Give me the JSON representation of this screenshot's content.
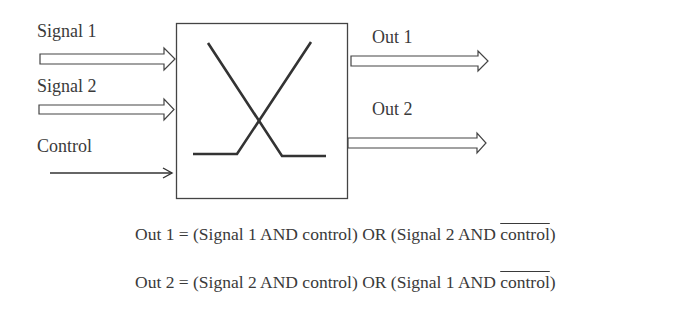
{
  "diagram": {
    "type": "switch/multiplexer block diagram",
    "inputs": [
      {
        "label": "Signal 1",
        "arrow": "hollow"
      },
      {
        "label": "Signal 2",
        "arrow": "hollow"
      },
      {
        "label": "Control",
        "arrow": "line"
      }
    ],
    "outputs": [
      {
        "label": "Out 1",
        "arrow": "hollow"
      },
      {
        "label": "Out 2",
        "arrow": "hollow"
      }
    ],
    "block_symbol": "crossed switch (X with horizontal feet)",
    "colors": {
      "stroke": "#333333",
      "background": "#ffffff"
    }
  },
  "equations": {
    "out1": {
      "prefix": "Out 1 = (Signal 1 AND control) OR (Signal 2 AND ",
      "negated": "control",
      "suffix": ")"
    },
    "out2": {
      "prefix": "Out 2 = (Signal 2 AND control) OR (Signal 1 AND ",
      "negated": "control",
      "suffix": ")"
    }
  }
}
